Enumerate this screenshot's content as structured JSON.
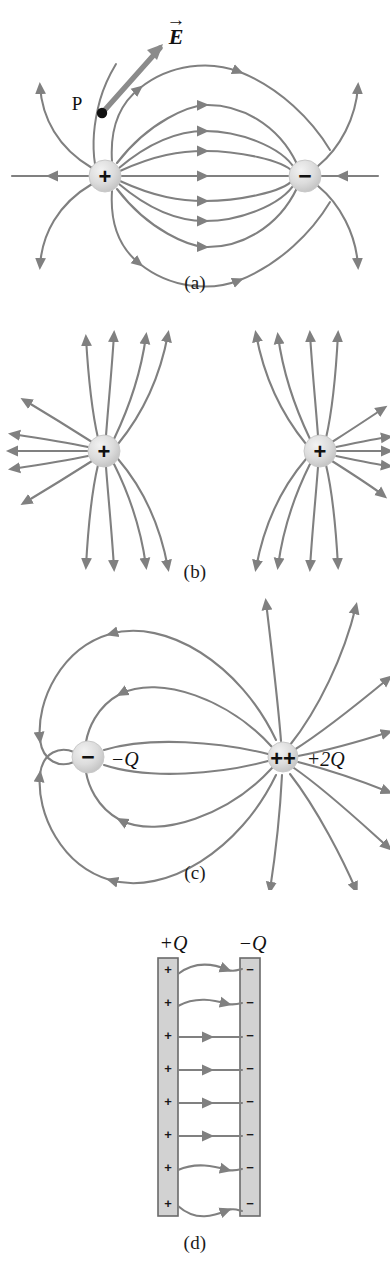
{
  "figure": {
    "line_color": "#808080",
    "charge_fill": "#d9d9d9",
    "charge_edge": "#bdbdbd",
    "plate_fill": "#d2d2d2",
    "plate_edge": "#6a6a6a",
    "text_color": "#111111",
    "background": "#ffffff"
  },
  "panels": [
    {
      "id": "a",
      "label": "(a)",
      "caption": "Electric dipole: equal and opposite point charges",
      "charges": [
        {
          "sign": "+",
          "glyph": "+",
          "x": 105,
          "y": 176,
          "r": 16
        },
        {
          "sign": "-",
          "glyph": "−",
          "x": 305,
          "y": 176,
          "r": 16
        }
      ],
      "annotations": [
        {
          "name": "point-p",
          "text": "P",
          "x": 77,
          "y": 108
        },
        {
          "name": "e-vector",
          "text": "E",
          "x": 176,
          "y": 40,
          "accent": "→"
        }
      ],
      "field_line_count": 13
    },
    {
      "id": "b",
      "label": "(b)",
      "caption": "Two equal positive point charges",
      "charges": [
        {
          "sign": "+",
          "glyph": "+",
          "x": 104,
          "y": 451,
          "r": 16
        },
        {
          "sign": "+",
          "glyph": "+",
          "x": 320,
          "y": 451,
          "r": 16
        }
      ],
      "annotations": [],
      "field_line_count": 20
    },
    {
      "id": "c",
      "label": "(c)",
      "caption": "Unequal unlike charges: minus Q and plus two Q",
      "charges": [
        {
          "sign": "-",
          "glyph": "−",
          "x": 88,
          "y": 757,
          "r": 16
        },
        {
          "sign": "++",
          "glyph": "++",
          "x": 283,
          "y": 757,
          "r": 15
        }
      ],
      "annotations": [
        {
          "name": "charge-label-minus-q",
          "sign": "−",
          "value": "Q",
          "x": 115,
          "y": 765
        },
        {
          "name": "charge-label-plus-2q",
          "sign": "+",
          "value": "2Q",
          "x": 312,
          "y": 765
        }
      ],
      "field_line_count": 16
    },
    {
      "id": "d",
      "label": "(d)",
      "caption": "Two oppositely charged parallel plates",
      "plates": [
        {
          "name": "positive-plate",
          "label_sign": "+",
          "label_value": "Q",
          "label_x": 174,
          "label_y": 944,
          "x": 158,
          "y": 958,
          "w": 20,
          "h": 258,
          "charge_glyph": "+",
          "charge_count": 8
        },
        {
          "name": "negative-plate",
          "label_sign": "−",
          "label_value": "Q",
          "label_x": 253,
          "label_y": 944,
          "x": 240,
          "y": 958,
          "w": 20,
          "h": 258,
          "charge_glyph": "−",
          "charge_count": 8
        }
      ],
      "field_line_count": 8
    }
  ]
}
